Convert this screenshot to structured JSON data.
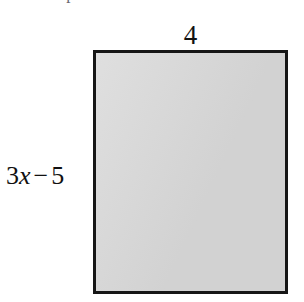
{
  "figure": {
    "type": "rectangle",
    "fill_color": "#d6d6d6",
    "border_color": "#161616",
    "background_color": "#ffffff"
  },
  "prompt": {
    "clipped_text": "Find the perimeter and the area of the rectangle."
  },
  "labels": {
    "top": {
      "name": "width-label",
      "text": "4"
    },
    "left": {
      "name": "height-label",
      "coefficient": "3",
      "variable": "x",
      "operator": "−",
      "constant": "5",
      "full_text": "3x − 5"
    }
  }
}
